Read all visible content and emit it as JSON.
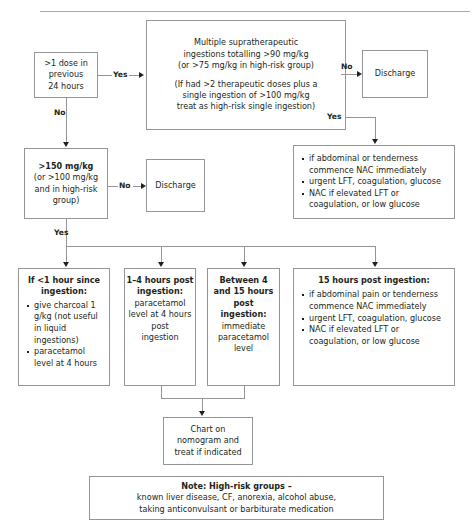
{
  "decisions": {
    "repeat_dose": {
      "lines": [
        ">1 dose in",
        "previous",
        "24 hours"
      ],
      "yes_label": "Yes",
      "no_label": "No"
    },
    "supratherapeutic": {
      "lines": [
        "Multiple supratherapeutic",
        "ingestions totalling >90 mg/kg",
        "(or >75 mg/kg in high-risk group)"
      ],
      "note_lines": [
        "(If had >2 therapeutic doses plus a",
        "single ingestion of >100 mg/kg",
        "treat as high-risk single ingestion)"
      ],
      "no_label": "No",
      "yes_label": "Yes"
    },
    "dose_threshold": {
      "lines": [
        ">150 mg/kg",
        "(or >100 mg/kg",
        "and in high-risk",
        "group)"
      ],
      "no_label": "No",
      "yes_label": "Yes"
    }
  },
  "discharge_top": {
    "label": "Discharge"
  },
  "discharge_mid": {
    "label": "Discharge"
  },
  "high_risk_actions": {
    "bullets": [
      "if abdominal or tenderness commence NAC immediately",
      "urgent LFT, coagulation, glucose",
      "NAC if elevated LFT or coagulation, or low glucose"
    ]
  },
  "timing_boxes": [
    {
      "heading_lines": [
        "If <1 hour since",
        "ingestion:"
      ],
      "bullets": [
        "give charcoal 1 g/kg (not useful in liquid ingestions)",
        "paracetamol level at 4 hours"
      ]
    },
    {
      "heading_lines": [
        "1–4 hours post",
        "ingestion:"
      ],
      "body_lines": [
        "paracetamol",
        "level at 4 hours",
        "post",
        "ingestion"
      ]
    },
    {
      "heading_lines": [
        "Between 4",
        "and 15 hours",
        "post",
        "ingestion:"
      ],
      "body_lines": [
        "immediate",
        "paracetamol",
        "level"
      ]
    },
    {
      "heading_lines": [
        "15 hours post ingestion:"
      ],
      "bullets": [
        "if abdominal pain or tenderness commence NAC immediately",
        "urgent LFT, coagulation, glucose",
        "NAC if elevated LFT or coagulation, or low glucose"
      ]
    }
  ],
  "nomogram": {
    "lines": [
      "Chart on",
      "nomogram and",
      "treat if indicated"
    ]
  },
  "note": {
    "heading": "Note: High-risk groups –",
    "lines": [
      "known liver disease, CF, anorexia, alcohol abuse,",
      "taking anticonvulsant or barbiturate medication"
    ]
  },
  "colors": {
    "box_border": "#939598",
    "text": "#231f20",
    "rule": "#a7a9ac"
  }
}
